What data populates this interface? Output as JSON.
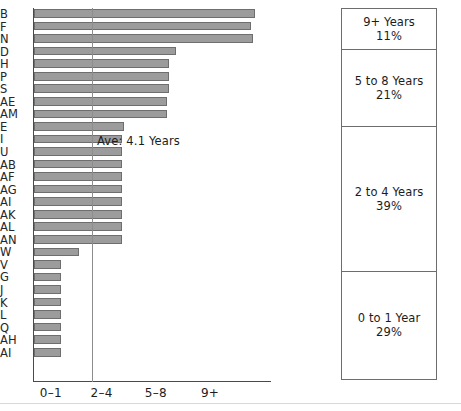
{
  "chart_data": {
    "type": "bar",
    "orientation": "horizontal",
    "title": "",
    "xlabel": "",
    "ylabel": "",
    "xlim": [
      0,
      10.5
    ],
    "grid": false,
    "legend": null,
    "tick_labels": [
      "0–1",
      "2–4",
      "5–8",
      "9+"
    ],
    "tick_values": [
      0.75,
      3.0,
      5.4,
      7.8
    ],
    "annotations": [
      {
        "text": "Ave: 4.1 Years",
        "value": 4.1
      }
    ],
    "categories": [
      "B",
      "F",
      "N",
      "D",
      "H",
      "P",
      "S",
      "AE",
      "AM",
      "E",
      "I",
      "U",
      "AB",
      "AF",
      "AG",
      "AI",
      "AK",
      "AL",
      "AN",
      "W",
      "V",
      "G",
      "J",
      "K",
      "L",
      "Q",
      "AH",
      "AI"
    ],
    "values": [
      9.8,
      9.6,
      9.7,
      6.3,
      6.0,
      6.0,
      6.0,
      5.9,
      5.9,
      4.0,
      3.9,
      3.9,
      3.9,
      3.9,
      3.9,
      3.9,
      3.9,
      3.9,
      3.9,
      2.0,
      1.2,
      1.2,
      1.2,
      1.2,
      1.2,
      1.2,
      1.2,
      1.2
    ],
    "series": [
      {
        "name": "Years",
        "values": [
          9.8,
          9.6,
          9.7,
          6.3,
          6.0,
          6.0,
          6.0,
          5.9,
          5.9,
          4.0,
          3.9,
          3.9,
          3.9,
          3.9,
          3.9,
          3.9,
          3.9,
          3.9,
          3.9,
          2.0,
          1.2,
          1.2,
          1.2,
          1.2,
          1.2,
          1.2,
          1.2,
          1.2
        ]
      }
    ],
    "bar_color": "#9c9c9c",
    "bar_edge_color": "#6e6e6e",
    "axis_color": "#4a4a4a",
    "average_line_color": "#8d8d8d",
    "side_panel": {
      "type": "stacked_bar",
      "segments": [
        {
          "label": "9+ Years",
          "pct_text": "11%",
          "value": 11
        },
        {
          "label": "5 to 8 Years",
          "pct_text": "21%",
          "value": 21
        },
        {
          "label": "2 to 4 Years",
          "pct_text": "39%",
          "value": 39
        },
        {
          "label": "0 to 1 Year",
          "pct_text": "29%",
          "value": 29
        }
      ],
      "border_color": "#6d6d6d",
      "fill_color": "#ffffff"
    }
  }
}
